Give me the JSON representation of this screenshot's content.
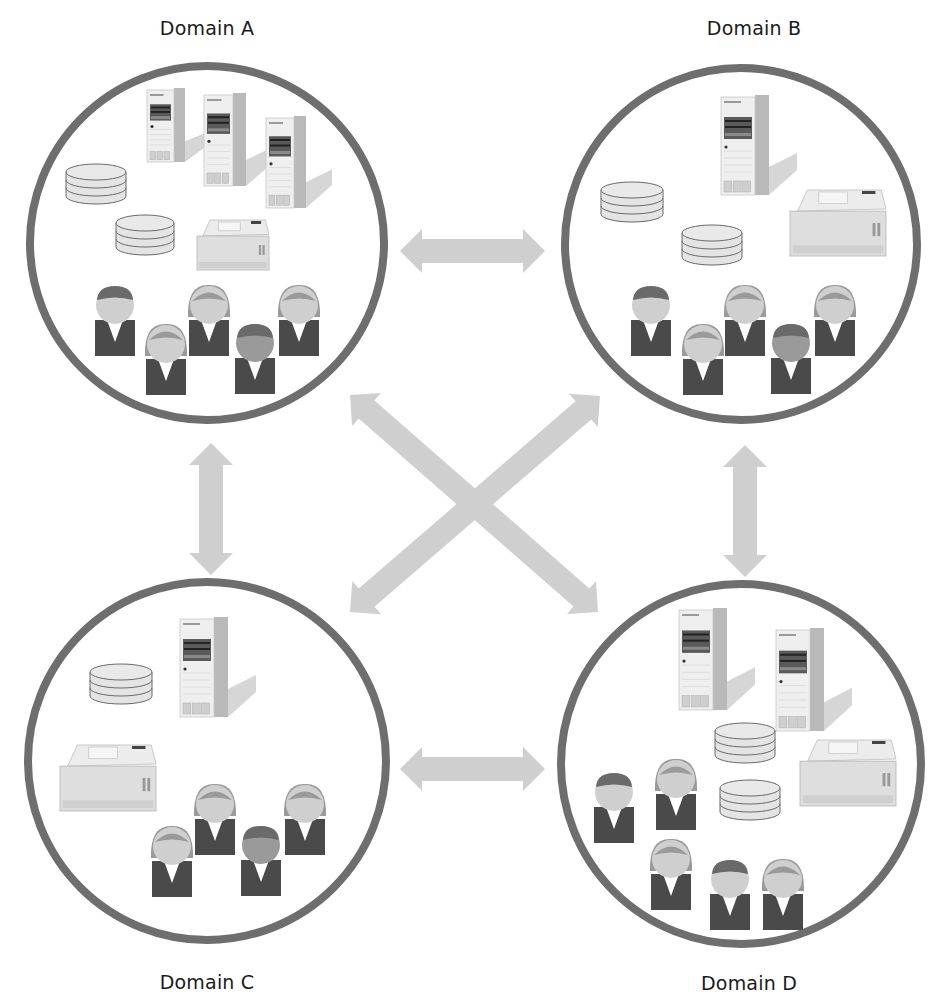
{
  "diagram": {
    "type": "domain-trust-network",
    "colors": {
      "background": "#ffffff",
      "circle_stroke": "#6e6e6e",
      "arrow_fill": "#cfcfcf",
      "label_text": "#1a1a1a",
      "server_front": "#efefef",
      "server_side": "#b9b9b9",
      "server_shadow": "#d6d6d6",
      "disk_fill": "#e4e4e4",
      "disk_stroke": "#6a6a6a",
      "printer_body": "#dedede",
      "printer_top": "#ececec",
      "person_suit": "#4a4a4a",
      "person_face": "#cfcfcf",
      "person_hair_male": "#6a6a6a",
      "person_hair_female": "#9a9a9a",
      "person_shirt": "#ffffff"
    },
    "domains": [
      {
        "id": "A",
        "label": "Domain A",
        "label_pos": [
          207,
          17
        ],
        "circle": {
          "cx": 207,
          "cy": 243,
          "r": 177
        },
        "servers": [
          [
            147,
            88,
            38,
            74
          ],
          [
            204,
            93,
            42,
            93
          ],
          [
            266,
            116,
            40,
            92
          ]
        ],
        "disks": [
          [
            66,
            172,
            60
          ],
          [
            116,
            223,
            58
          ]
        ],
        "printers": [
          [
            197,
            220,
            72,
            50
          ]
        ],
        "people": [
          {
            "x": 115,
            "y": 316,
            "g": "m"
          },
          {
            "x": 166,
            "y": 355,
            "g": "f"
          },
          {
            "x": 209,
            "y": 316,
            "g": "f"
          },
          {
            "x": 255,
            "y": 354,
            "g": "m",
            "dark": true
          },
          {
            "x": 299,
            "y": 316,
            "g": "f"
          }
        ]
      },
      {
        "id": "B",
        "label": "Domain B",
        "label_pos": [
          754,
          17
        ],
        "circle": {
          "cx": 741,
          "cy": 244,
          "r": 176
        },
        "servers": [
          [
            721,
            95,
            48,
            100
          ]
        ],
        "disks": [
          [
            601,
            190,
            62
          ],
          [
            682,
            233,
            60
          ]
        ],
        "printers": [
          [
            790,
            190,
            96,
            66
          ]
        ],
        "people": [
          {
            "x": 651,
            "y": 316,
            "g": "m"
          },
          {
            "x": 703,
            "y": 355,
            "g": "f"
          },
          {
            "x": 745,
            "y": 316,
            "g": "f"
          },
          {
            "x": 791,
            "y": 354,
            "g": "m",
            "dark": true
          },
          {
            "x": 835,
            "y": 316,
            "g": "f"
          }
        ]
      },
      {
        "id": "C",
        "label": "Domain C",
        "label_pos": [
          207,
          971
        ],
        "circle": {
          "cx": 207,
          "cy": 761,
          "r": 179
        },
        "servers": [
          [
            180,
            617,
            48,
            100
          ]
        ],
        "disks": [
          [
            90,
            672,
            62
          ]
        ],
        "printers": [
          [
            60,
            745,
            96,
            66
          ]
        ],
        "people": [
          {
            "x": 172,
            "y": 857,
            "g": "f"
          },
          {
            "x": 215,
            "y": 815,
            "g": "f"
          },
          {
            "x": 261,
            "y": 856,
            "g": "m",
            "dark": true
          },
          {
            "x": 305,
            "y": 815,
            "g": "f"
          }
        ]
      },
      {
        "id": "D",
        "label": "Domain D",
        "label_pos": [
          749,
          972
        ],
        "circle": {
          "cx": 741,
          "cy": 764,
          "r": 180
        },
        "servers": [
          [
            679,
            608,
            48,
            102
          ],
          [
            776,
            628,
            48,
            103
          ]
        ],
        "disks": [
          [
            715,
            731,
            60
          ],
          [
            720,
            788,
            60
          ]
        ],
        "printers": [
          [
            800,
            740,
            96,
            66
          ]
        ],
        "people": [
          {
            "x": 614,
            "y": 803,
            "g": "m"
          },
          {
            "x": 676,
            "y": 790,
            "g": "f"
          },
          {
            "x": 671,
            "y": 870,
            "g": "f"
          },
          {
            "x": 730,
            "y": 890,
            "g": "m"
          },
          {
            "x": 783,
            "y": 890,
            "g": "f"
          }
        ]
      }
    ],
    "connections": [
      {
        "from": "A",
        "to": "B",
        "label": "A-B trust",
        "x1": 400,
        "y1": 251,
        "x2": 545,
        "y2": 251
      },
      {
        "from": "C",
        "to": "D",
        "label": "C-D trust",
        "x1": 400,
        "y1": 769,
        "x2": 545,
        "y2": 769
      },
      {
        "from": "A",
        "to": "C",
        "label": "A-C trust",
        "x1": 211,
        "y1": 443,
        "x2": 211,
        "y2": 575
      },
      {
        "from": "B",
        "to": "D",
        "label": "B-D trust",
        "x1": 745,
        "y1": 445,
        "x2": 745,
        "y2": 577
      },
      {
        "from": "A",
        "to": "D",
        "label": "A-D trust",
        "x1": 350,
        "y1": 395,
        "x2": 598,
        "y2": 612
      },
      {
        "from": "B",
        "to": "C",
        "label": "B-C trust",
        "x1": 600,
        "y1": 396,
        "x2": 350,
        "y2": 612
      }
    ]
  }
}
